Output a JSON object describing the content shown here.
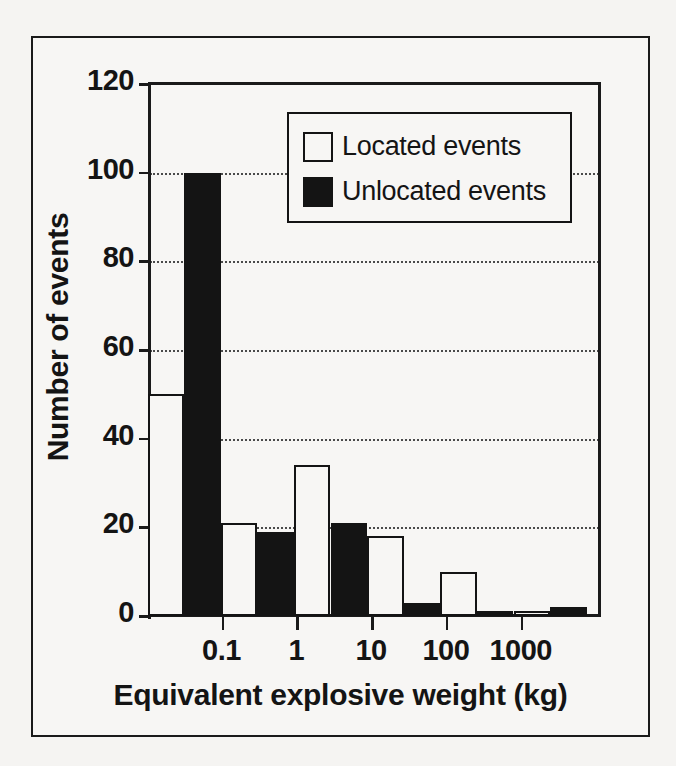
{
  "figure": {
    "background_color": "#f5f4f2",
    "ink_color": "#141414"
  },
  "chart_data": {
    "type": "bar",
    "title": "",
    "xlabel": "Equivalent explosive weight (kg)",
    "ylabel": "Number of events",
    "ylim": [
      0,
      120
    ],
    "yticks": [
      0,
      20,
      40,
      60,
      80,
      100,
      120
    ],
    "ytick_labels": [
      "0",
      "20",
      "40",
      "60",
      "80",
      "100",
      "120"
    ],
    "xscale": "log",
    "xticks": [
      0.1,
      1,
      10,
      100,
      1000
    ],
    "xtick_labels": [
      "0.1",
      "1",
      "10",
      "100",
      "1000"
    ],
    "grid": "horizontal-dotted",
    "legend_position": "upper-center",
    "series": [
      {
        "name": "Located events",
        "color": "#ffffff",
        "edge_color": "#141414",
        "values": [
          50,
          21,
          34,
          18,
          10,
          1
        ]
      },
      {
        "name": "Unlocated events",
        "color": "#141414",
        "edge_color": "#141414",
        "values": [
          100,
          19,
          21,
          3,
          1,
          2
        ]
      }
    ],
    "bins": [
      {
        "label": "0.01-0.1",
        "located": 50,
        "unlocated": 100
      },
      {
        "label": "0.1-1",
        "located": 21,
        "unlocated": 19
      },
      {
        "label": "1-10",
        "located": 34,
        "unlocated": 21
      },
      {
        "label": "10-100",
        "located": 18,
        "unlocated": 3
      },
      {
        "label": "100-1000",
        "located": 10,
        "unlocated": 1
      },
      {
        "label": "1000-10000",
        "located": 1,
        "unlocated": 2
      }
    ]
  },
  "legend": {
    "items": [
      {
        "label": "Located events",
        "swatch": "white-square"
      },
      {
        "label": "Unlocated events",
        "swatch": "black-square"
      }
    ]
  }
}
